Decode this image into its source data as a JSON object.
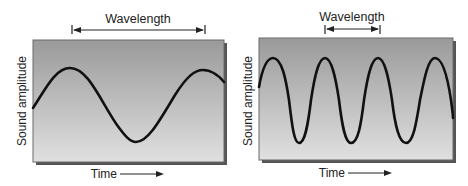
{
  "diagrams": [
    {
      "id": "low-frequency",
      "wavelength_label": "Wavelength",
      "y_axis_label": "Sound amplitude",
      "x_axis_label": "Time",
      "cycles_shown": 1.25,
      "description": "Long wavelength sine wave"
    },
    {
      "id": "high-frequency",
      "wavelength_label": "Wavelength",
      "y_axis_label": "Sound amplitude",
      "x_axis_label": "Time",
      "cycles_shown": 3.5,
      "description": "Short wavelength sine wave"
    }
  ],
  "colors": {
    "panel_top": "#9c9c9c",
    "panel_bottom": "#dedede",
    "panel_border": "#6a6a6a",
    "shadow": "#555555",
    "wave": "#111111",
    "text": "#222222"
  }
}
